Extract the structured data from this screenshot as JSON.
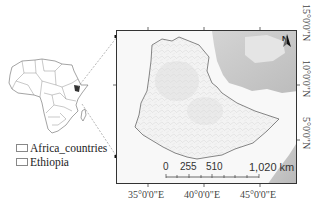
{
  "legend": {
    "items": [
      {
        "label": "Africa_countries"
      },
      {
        "label": "Ethiopia"
      }
    ]
  },
  "map": {
    "north_arrow": "N",
    "lat_labels": [
      "15°0'0\"N",
      "10°0'0\"N",
      "5°0'0\"N"
    ],
    "lon_labels": [
      "35°0'0\"E",
      "40°0'0\"E",
      "45°0'0\"E"
    ],
    "scalebar": {
      "ticks": [
        "0",
        "255",
        "510",
        "1,020 km"
      ]
    },
    "colors": {
      "frame": "#333333",
      "sea": "#b8b8b8",
      "land": "#f4f4f4",
      "border": "#555555"
    }
  }
}
